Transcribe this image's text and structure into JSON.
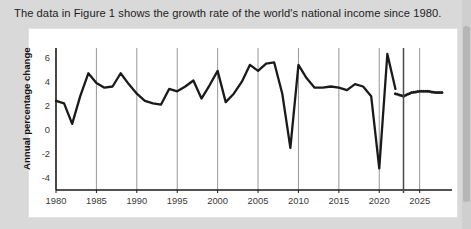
{
  "caption": {
    "text": "The data in Figure 1 shows the growth rate of the world's national income since 1980."
  },
  "colors": {
    "page_background": "#d9d9d9",
    "card_background": "#ffffff",
    "line": "#1a1a1a",
    "gridline": "#8c8c8c",
    "axis": "#1a1a1a",
    "text": "#1d1d1d"
  },
  "chart_data": {
    "type": "line",
    "title": "",
    "xlabel": "",
    "ylabel": "Annual percentage change",
    "xlim": [
      1980,
      2029
    ],
    "ylim": [
      -5,
      6.8
    ],
    "yticks": [
      6,
      4,
      2,
      0,
      -2,
      -4
    ],
    "ytick_labels": [
      "6",
      "4",
      "2",
      "0",
      "-2",
      "-4"
    ],
    "xticks": [
      1980,
      1985,
      1990,
      1995,
      2000,
      2005,
      2010,
      2015,
      2020,
      2025
    ],
    "xtick_labels": [
      "1980",
      "1985",
      "1990",
      "1995",
      "2000",
      "2005",
      "2010",
      "2015",
      "2020",
      "2025"
    ],
    "gridlines_x": [
      1985,
      1990,
      1995,
      2000,
      2005,
      2010,
      2015,
      2020,
      2025
    ],
    "grid": "vertical",
    "legend": "none",
    "divider_x": 2023,
    "series": [
      {
        "name": "Actual",
        "style": "solid",
        "x": [
          1980,
          1981,
          1982,
          1983,
          1984,
          1985,
          1986,
          1987,
          1988,
          1989,
          1990,
          1991,
          1992,
          1993,
          1994,
          1995,
          1996,
          1997,
          1998,
          1999,
          2000,
          2001,
          2002,
          2003,
          2004,
          2005,
          2006,
          2007,
          2008,
          2009,
          2010,
          2011,
          2012,
          2013,
          2014,
          2015,
          2016,
          2017,
          2018,
          2019,
          2020,
          2021,
          2022
        ],
        "values": [
          2.4,
          2.2,
          0.5,
          2.8,
          4.7,
          3.9,
          3.5,
          3.6,
          4.7,
          3.8,
          3.0,
          2.4,
          2.2,
          2.1,
          3.4,
          3.2,
          3.6,
          4.1,
          2.6,
          3.7,
          4.9,
          2.3,
          3.0,
          4.0,
          5.4,
          4.9,
          5.5,
          5.6,
          3.0,
          -1.5,
          5.4,
          4.3,
          3.5,
          3.5,
          3.6,
          3.5,
          3.3,
          3.8,
          3.6,
          2.8,
          -3.2,
          6.3,
          3.4
        ]
      },
      {
        "name": "Projection",
        "style": "dotted",
        "x": [
          2022,
          2023,
          2024,
          2025,
          2026,
          2027,
          2028
        ],
        "values": [
          3.0,
          2.8,
          3.1,
          3.2,
          3.2,
          3.1,
          3.1
        ]
      }
    ]
  }
}
